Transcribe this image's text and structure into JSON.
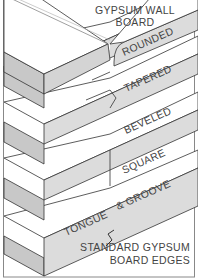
{
  "title": {
    "line1": "GYPSUM WALL",
    "line2": "BOARD"
  },
  "edge_labels": [
    {
      "name": "rounded",
      "text": "ROUNDED"
    },
    {
      "name": "tapered",
      "text": "TAPERED"
    },
    {
      "name": "beveled",
      "text": "BEVELED"
    },
    {
      "name": "square",
      "text": "SQUARE"
    },
    {
      "name": "tongue",
      "text": "TONGUE"
    },
    {
      "name": "groove",
      "text": "& GROOVE"
    }
  ],
  "caption": {
    "line1": "STANDARD GYPSUM",
    "line2": "BOARD EDGES"
  },
  "colors": {
    "top_face": "#ffffff",
    "left_face": "#c8c8c8",
    "right_face": "#dcdcdc",
    "outline": "#333333",
    "frame": "#888888"
  }
}
